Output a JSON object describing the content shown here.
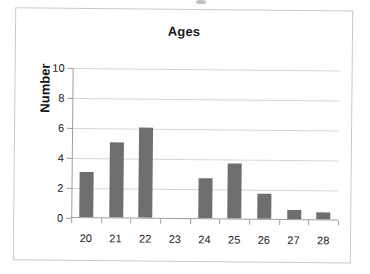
{
  "chart_data": {
    "type": "bar",
    "title": "Ages",
    "xlabel": "",
    "ylabel": "Number",
    "categories": [
      "20",
      "21",
      "22",
      "23",
      "24",
      "25",
      "26",
      "27",
      "28"
    ],
    "values": [
      3,
      5,
      6,
      0,
      2.7,
      3.7,
      1.7,
      0.6,
      0.5
    ],
    "ylim": [
      0,
      10
    ],
    "yticks": [
      "0",
      "2",
      "4",
      "6",
      "8",
      "10"
    ],
    "ytick_values": [
      0,
      2,
      4,
      6,
      8,
      10
    ],
    "grid": true,
    "legend": false,
    "bar_color": "#6e6e6e",
    "gridline_color": "#d6d6d6",
    "axis_color": "#9e9e9e",
    "background_color": "#ffffff"
  }
}
